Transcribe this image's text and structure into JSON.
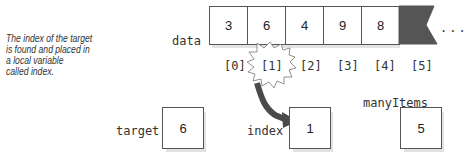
{
  "caption": {
    "lines": [
      "The index of the target",
      "is found and placed in",
      "a local variable",
      "called index."
    ]
  },
  "array": {
    "name": "data",
    "values": [
      "3",
      "6",
      "4",
      "9",
      "8"
    ],
    "indices": [
      "[0]",
      "[1]",
      "[2]",
      "[3]",
      "[4]",
      "[5]"
    ],
    "ellipsis": "...",
    "highlighted_index": "[1]"
  },
  "variables": {
    "target": {
      "name": "target",
      "value": "6"
    },
    "index": {
      "name": "index",
      "value": "1"
    },
    "manyItems": {
      "name": "manyItems",
      "value": "5"
    }
  },
  "colors": {
    "unused_cell": "#555555",
    "arrow": "#4a4a4a",
    "border": "#555555",
    "shadow": "#e2e2e2"
  }
}
